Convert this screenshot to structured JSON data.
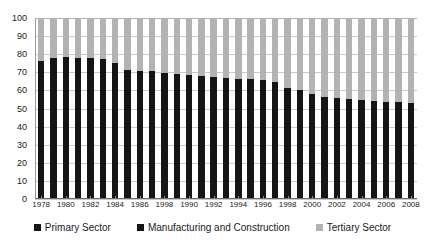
{
  "chart_data": {
    "type": "bar",
    "title": "",
    "subtitle": "",
    "xlabel": "",
    "ylabel": "",
    "stacked": true,
    "stack_mode": "percent",
    "grid": true,
    "legend_position": "bottom",
    "ylim": [
      0,
      100
    ],
    "ytick_labels": [
      "0",
      "10",
      "20",
      "30",
      "40",
      "50",
      "60",
      "70",
      "80",
      "90",
      "100"
    ],
    "ytick_values": [
      0,
      10,
      20,
      30,
      40,
      50,
      60,
      70,
      80,
      90,
      100
    ],
    "categories": [
      "1978",
      "1979",
      "1980",
      "1981",
      "1982",
      "1983",
      "1984",
      "1985",
      "1986",
      "1987",
      "1988",
      "1989",
      "1990",
      "1991",
      "1992",
      "1993",
      "1994",
      "1995",
      "1996",
      "1997",
      "1998",
      "1999",
      "2000",
      "2001",
      "2002",
      "2003",
      "2004",
      "2005",
      "2006",
      "2007",
      "2008"
    ],
    "xtick_labels": [
      "1978",
      "1980",
      "1982",
      "1984",
      "1986",
      "1998",
      "1990",
      "1992",
      "1994",
      "1996",
      "1998",
      "2000",
      "2002",
      "2004",
      "2006",
      "2008"
    ],
    "xtick_label_indices": [
      0,
      2,
      4,
      6,
      8,
      10,
      12,
      14,
      16,
      18,
      20,
      22,
      24,
      26,
      28,
      30
    ],
    "series": [
      {
        "name": "Primary Sector",
        "color": "#151515",
        "values": [
          28.5,
          29.0,
          29.5,
          32.5,
          33.0,
          34.0,
          34.0,
          28.5,
          28.0,
          27.5,
          27.0,
          27.0,
          27.0,
          26.5,
          26.0,
          26.0,
          25.5,
          25.0,
          24.5,
          24.0,
          23.5,
          23.0,
          22.5,
          22.0,
          21.0,
          20.0,
          19.0,
          18.0,
          17.5,
          17.0,
          16.5
        ]
      },
      {
        "name": "Manufacturing and Construction",
        "color": "#151515",
        "values": [
          47.5,
          49.0,
          49.0,
          45.5,
          45.0,
          43.5,
          41.0,
          43.0,
          43.0,
          43.5,
          42.5,
          42.0,
          41.5,
          41.5,
          41.5,
          41.0,
          41.0,
          41.5,
          41.5,
          40.5,
          38.0,
          37.0,
          35.5,
          34.5,
          35.0,
          35.0,
          35.5,
          36.0,
          36.0,
          36.5,
          36.5
        ]
      },
      {
        "name": "Tertiary Sector",
        "color": "#b3b3b3",
        "values": [
          24.0,
          22.0,
          21.5,
          22.0,
          22.0,
          22.5,
          25.0,
          28.5,
          29.0,
          29.0,
          30.5,
          31.0,
          31.5,
          32.0,
          32.5,
          33.0,
          33.5,
          33.5,
          34.0,
          35.5,
          38.5,
          40.0,
          42.0,
          43.5,
          44.0,
          45.0,
          45.5,
          46.0,
          46.5,
          46.5,
          47.0
        ]
      }
    ],
    "legend": [
      {
        "label": "Primary Sector",
        "color": "#151515"
      },
      {
        "label": "Manufacturing and Construction",
        "color": "#151515"
      },
      {
        "label": "Tertiary Sector",
        "color": "#b3b3b3"
      }
    ]
  }
}
